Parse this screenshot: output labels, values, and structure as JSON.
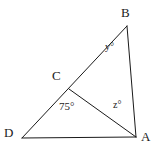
{
  "figure": {
    "kind": "geometry-diagram",
    "background_color": "#ffffff",
    "stroke_color": "#1a1a1a",
    "stroke_width": 1,
    "width": 164,
    "height": 158,
    "points": {
      "A": {
        "label": "A",
        "x": 136,
        "y": 137
      },
      "B": {
        "label": "B",
        "x": 127,
        "y": 26
      },
      "C": {
        "label": "C",
        "x": 69,
        "y": 89
      },
      "D": {
        "label": "D",
        "x": 22,
        "y": 138
      }
    },
    "segments": [
      {
        "name": "segment-DB",
        "from": "D",
        "to": "B",
        "path": "M 22 138 L 127 26"
      },
      {
        "name": "segment-BA",
        "from": "B",
        "to": "A",
        "path": "M 127 26 L 136 137"
      },
      {
        "name": "segment-DA",
        "from": "D",
        "to": "A",
        "path": "M 22 138 L 136 137"
      },
      {
        "name": "segment-CA",
        "from": "C",
        "to": "A",
        "path": "M 69 89 L 136 137"
      }
    ],
    "angles": [
      {
        "name": "angle-at-B",
        "label": "y°",
        "at": "B",
        "x": 105,
        "y": 42
      },
      {
        "name": "angle-DCA",
        "label": "75°",
        "at": "C",
        "x": 59,
        "y": 101
      },
      {
        "name": "angle-CAB",
        "label": "z°",
        "at": "A",
        "x": 113,
        "y": 100
      }
    ]
  }
}
